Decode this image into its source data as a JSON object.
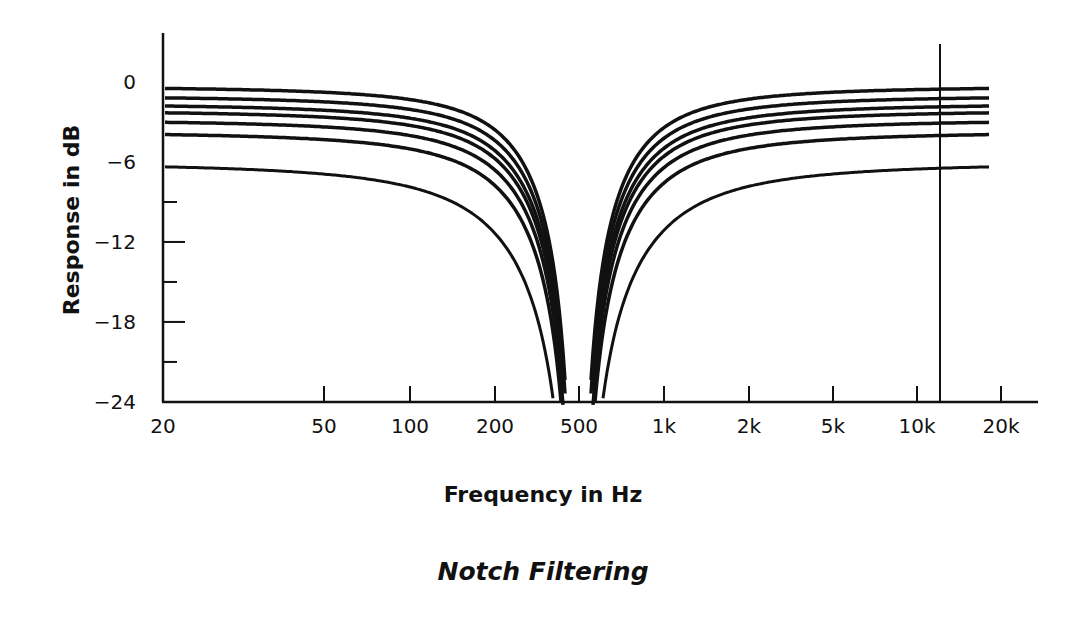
{
  "chart_data": {
    "type": "line",
    "title": "Notch Filtering",
    "xlabel": "Frequency in Hz",
    "ylabel": "Response in dB",
    "x_scale": "log",
    "x_ticks": [
      {
        "label": "20",
        "value": 20,
        "px": 163
      },
      {
        "label": "50",
        "value": 50,
        "px": 324
      },
      {
        "label": "100",
        "value": 100,
        "px": 410
      },
      {
        "label": "200",
        "value": 200,
        "px": 495
      },
      {
        "label": "500",
        "value": 500,
        "px": 579
      },
      {
        "label": "1k",
        "value": 1000,
        "px": 664
      },
      {
        "label": "2k",
        "value": 2000,
        "px": 749
      },
      {
        "label": "5k",
        "value": 5000,
        "px": 833
      },
      {
        "label": "10k",
        "value": 10000,
        "px": 917
      },
      {
        "label": "20k",
        "value": 20000,
        "px": 1001
      }
    ],
    "y_ticks": [
      {
        "value": 0,
        "label": "0"
      },
      {
        "value": -3,
        "label": ""
      },
      {
        "value": -6,
        "label": "−6"
      },
      {
        "value": -9,
        "label": ""
      },
      {
        "value": -12,
        "label": "−12"
      },
      {
        "value": -15,
        "label": ""
      },
      {
        "value": -18,
        "label": "−18"
      },
      {
        "value": -21,
        "label": ""
      },
      {
        "value": -24,
        "label": "−24"
      }
    ],
    "ylim": [
      -24,
      2.5
    ],
    "xlim": [
      20,
      28000
    ],
    "grid": false,
    "legend": null,
    "notch_center_hz": 500,
    "reference_line_hz": 13000,
    "series": [
      {
        "name": "curve-1",
        "passband_db": -0.3,
        "notch_width": 0.95
      },
      {
        "name": "curve-2",
        "passband_db": -1.0,
        "notch_width": 0.97
      },
      {
        "name": "curve-3",
        "passband_db": -1.6,
        "notch_width": 1.0
      },
      {
        "name": "curve-4",
        "passband_db": -2.1,
        "notch_width": 1.02
      },
      {
        "name": "curve-5",
        "passband_db": -2.8,
        "notch_width": 1.05
      },
      {
        "name": "curve-6",
        "passband_db": -3.7,
        "notch_width": 1.1
      },
      {
        "name": "curve-7",
        "passband_db": -6.0,
        "notch_width": 1.35
      }
    ]
  }
}
